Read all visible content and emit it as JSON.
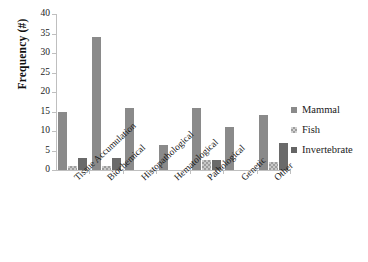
{
  "chart_data": {
    "type": "bar",
    "title": "",
    "xlabel": "",
    "ylabel": "Frequency (#)",
    "ylim": [
      0,
      40
    ],
    "ytick_step": 5,
    "yticks": [
      40,
      35,
      30,
      25,
      20,
      15,
      10,
      5,
      0
    ],
    "grid": false,
    "legend_position": "right",
    "orientation": "vertical",
    "grouping": "grouped",
    "categories": [
      "Tissue Accumulation",
      "Biochemical",
      "Histopathological",
      "Hematological",
      "Pathological",
      "Genetic",
      "Other"
    ],
    "series": [
      {
        "name": "Mammal",
        "color": "#8a8a8a",
        "pattern": "dotted-gray",
        "values": [
          15,
          34,
          16,
          6.5,
          16,
          11,
          14
        ]
      },
      {
        "name": "Fish",
        "color": "#d2d2d2",
        "pattern": "checkered-light",
        "values": [
          1,
          1,
          0,
          0,
          2.5,
          0,
          2
        ]
      },
      {
        "name": "Invertebrate",
        "color": "#656565",
        "pattern": "solid-dark",
        "values": [
          3,
          3,
          0,
          0,
          2.5,
          0,
          7
        ]
      }
    ]
  },
  "axis": {
    "y_title": "Frequency (#)"
  },
  "legend": {
    "entries": [
      {
        "label": "Mammal"
      },
      {
        "label": "Fish"
      },
      {
        "label": "Invertebrate"
      }
    ]
  },
  "colors": {
    "mammal": "#8a8a8a",
    "fish": "#d2d2d2",
    "invertebrate": "#656565",
    "axis": "#bfbfbf",
    "text": "#1a1a1a",
    "background": "#ffffff"
  }
}
